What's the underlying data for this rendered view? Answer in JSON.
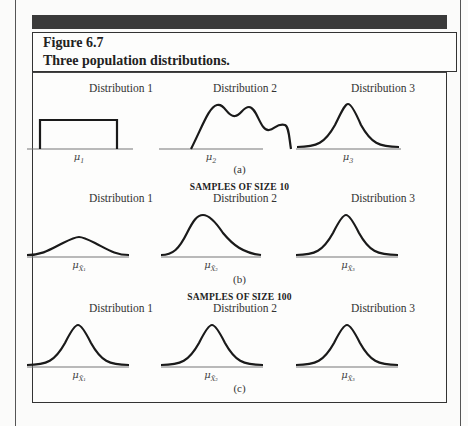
{
  "figure": {
    "number": "Figure 6.7",
    "title": "Three population distributions."
  },
  "panels": [
    {
      "id": "a",
      "letter": "(a)",
      "section_title": "",
      "distributions": [
        {
          "label": "Distribution 1",
          "shape": "uniform",
          "mean_label": "μ",
          "mean_sub": "1",
          "xbar": false
        },
        {
          "label": "Distribution 2",
          "shape": "multimodal",
          "mean_label": "μ",
          "mean_sub": "2",
          "xbar": false
        },
        {
          "label": "Distribution 3",
          "shape": "normal",
          "mean_label": "μ",
          "mean_sub": "3",
          "xbar": false
        }
      ]
    },
    {
      "id": "b",
      "letter": "(b)",
      "section_title": "SAMPLES OF SIZE 10",
      "distributions": [
        {
          "label": "Distribution 1",
          "shape": "wide-normal",
          "mean_label": "μ",
          "mean_sub": "X̄₁",
          "xbar": true
        },
        {
          "label": "Distribution 2",
          "shape": "right-skewed",
          "mean_label": "μ",
          "mean_sub": "X̄₂",
          "xbar": true
        },
        {
          "label": "Distribution 3",
          "shape": "normal",
          "mean_label": "μ",
          "mean_sub": "X̄₃",
          "xbar": true
        }
      ]
    },
    {
      "id": "c",
      "letter": "(c)",
      "section_title": "SAMPLES OF SIZE 100",
      "distributions": [
        {
          "label": "Distribution 1",
          "shape": "normal",
          "mean_label": "μ",
          "mean_sub": "X̄₁",
          "xbar": true
        },
        {
          "label": "Distribution 2",
          "shape": "normal",
          "mean_label": "μ",
          "mean_sub": "X̄₂",
          "xbar": true
        },
        {
          "label": "Distribution 3",
          "shape": "normal",
          "mean_label": "μ",
          "mean_sub": "X̄₃",
          "xbar": true
        }
      ]
    }
  ],
  "colors": {
    "header_bar": "#3a3a3a",
    "stroke": "#1a1a1a",
    "axis": "#666666"
  }
}
